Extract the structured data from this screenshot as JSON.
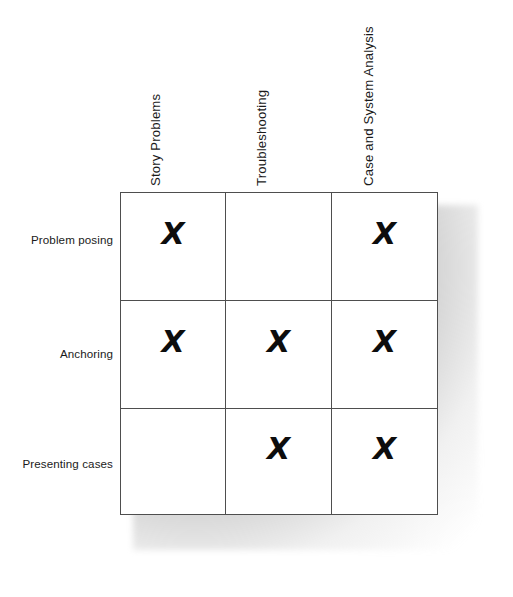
{
  "figure": {
    "type": "matrix-table",
    "title": ""
  },
  "columns": [
    {
      "id": "story-problems",
      "label": "Story Problems"
    },
    {
      "id": "troubleshooting",
      "label": "Troubleshooting"
    },
    {
      "id": "case-and-system-analysis",
      "label": "Case and System Analysis"
    }
  ],
  "rows": [
    {
      "id": "problem-posing",
      "label": "Problem posing"
    },
    {
      "id": "anchoring",
      "label": "Anchoring"
    },
    {
      "id": "presenting-cases",
      "label": "Presenting cases"
    }
  ],
  "mark_symbol": "X",
  "cells": [
    [
      {
        "marked": true,
        "mark": "X"
      },
      {
        "marked": false,
        "mark": ""
      },
      {
        "marked": true,
        "mark": "X"
      }
    ],
    [
      {
        "marked": true,
        "mark": "X"
      },
      {
        "marked": true,
        "mark": "X"
      },
      {
        "marked": true,
        "mark": "X"
      }
    ],
    [
      {
        "marked": false,
        "mark": ""
      },
      {
        "marked": true,
        "mark": "X"
      },
      {
        "marked": true,
        "mark": "X"
      }
    ]
  ],
  "colors": {
    "background": "#ffffff",
    "grid_line": "#4e4e4e",
    "text": "#1a1a1a",
    "mark": "#0d0d0d",
    "shadow": "#8c8c8c"
  }
}
